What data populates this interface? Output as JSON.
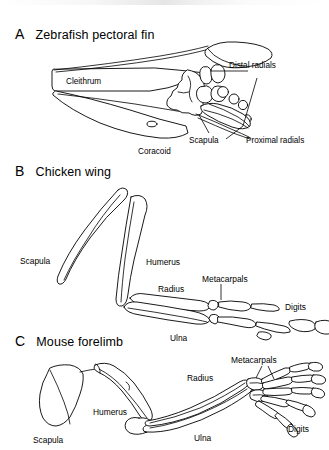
{
  "figure": {
    "background_color": "#ffffff",
    "line_color": "#000000",
    "type": "scientific-anatomical-comparative-diagram"
  },
  "panels": [
    {
      "letter": "A",
      "title": "Zebrafish pectoral fin",
      "labels": [
        {
          "name": "cleithrum",
          "text": "Cleithrum"
        },
        {
          "name": "coracoid",
          "text": "Coracoid"
        },
        {
          "name": "scapula",
          "text": "Scapula"
        },
        {
          "name": "distal-radials",
          "text": "Distal radials"
        },
        {
          "name": "proximal-radials",
          "text": "Proximal radials"
        }
      ]
    },
    {
      "letter": "B",
      "title": "Chicken wing",
      "labels": [
        {
          "name": "scapula",
          "text": "Scapula"
        },
        {
          "name": "humerus",
          "text": "Humerus"
        },
        {
          "name": "radius",
          "text": "Radius"
        },
        {
          "name": "ulna",
          "text": "Ulna"
        },
        {
          "name": "metacarpals",
          "text": "Metacarpals"
        },
        {
          "name": "digits",
          "text": "Digits"
        }
      ]
    },
    {
      "letter": "C",
      "title": "Mouse forelimb",
      "labels": [
        {
          "name": "scapula",
          "text": "Scapula"
        },
        {
          "name": "humerus",
          "text": "Humerus"
        },
        {
          "name": "radius",
          "text": "Radius"
        },
        {
          "name": "ulna",
          "text": "Ulna"
        },
        {
          "name": "metacarpals",
          "text": "Metacarpals"
        },
        {
          "name": "digits",
          "text": "Digits"
        }
      ]
    }
  ]
}
